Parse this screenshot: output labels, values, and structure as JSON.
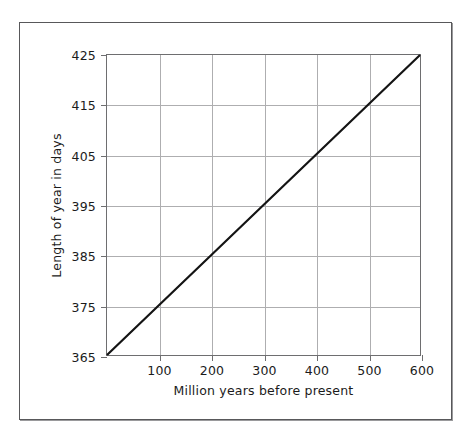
{
  "chart_data": {
    "type": "line",
    "title": "",
    "xlabel": "Million years before present",
    "ylabel": "Length of year in days",
    "xlim": [
      0,
      600
    ],
    "ylim": [
      365,
      425
    ],
    "grid": true,
    "legend": false,
    "x_ticks": [
      100,
      200,
      300,
      400,
      500,
      600
    ],
    "x_tick_labels": [
      "100",
      "200",
      "300",
      "400",
      "500",
      "600"
    ],
    "y_ticks": [
      365,
      375,
      385,
      395,
      405,
      415,
      425
    ],
    "y_tick_labels": [
      "365",
      "375",
      "385",
      "395",
      "405",
      "415",
      "425"
    ],
    "series": [
      {
        "name": "Length of year",
        "color": "#141414",
        "x": [
          0,
          100,
          200,
          300,
          400,
          500,
          600
        ],
        "values": [
          365,
          375,
          385,
          395,
          405,
          415,
          425
        ]
      }
    ]
  },
  "style": {
    "grid_color": "#aeaeb0",
    "axis_color": "#6e6e70",
    "frame_color": "#58585a",
    "line_color": "#141414",
    "text_color": "#1b1b1b",
    "background": "#ffffff"
  }
}
